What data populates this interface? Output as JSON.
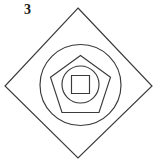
{
  "figure": {
    "label": "3",
    "caption_number": "3",
    "canvas": {
      "width": 159,
      "height": 166,
      "background_color": "#ffffff"
    },
    "style": {
      "stroke_color": "#3a3a3a",
      "label_color": "#1a1a1a",
      "fill": "none",
      "stroke_width": 1.15
    },
    "shapes": [
      {
        "name": "diamond",
        "type": "polygon",
        "order": 1,
        "points": "78,8 152,86 78,158 5,86",
        "vertices": [
          {
            "x": 78,
            "y": 8
          },
          {
            "x": 152,
            "y": 86
          },
          {
            "x": 78,
            "y": 158
          },
          {
            "x": 5,
            "y": 86
          }
        ]
      },
      {
        "name": "outer-circle",
        "type": "circle",
        "order": 2,
        "cx": 80.5,
        "cy": 85,
        "r": 40.5
      },
      {
        "name": "pentagon",
        "type": "polygon",
        "order": 3,
        "points": "80.5,55.5 110.5,77.3 99,112.5 62,112.5 50.5,77.3",
        "vertices": [
          {
            "x": 80.5,
            "y": 55.5
          },
          {
            "x": 110.5,
            "y": 77.3
          },
          {
            "x": 99,
            "y": 112.5
          },
          {
            "x": 62,
            "y": 112.5
          },
          {
            "x": 50.5,
            "y": 77.3
          }
        ]
      },
      {
        "name": "inner-circle",
        "type": "circle",
        "order": 4,
        "cx": 80.5,
        "cy": 84.5,
        "r": 18.5
      },
      {
        "name": "inner-square",
        "type": "rect",
        "order": 5,
        "x": 71.5,
        "y": 75.5,
        "width": 18,
        "height": 18
      }
    ]
  }
}
